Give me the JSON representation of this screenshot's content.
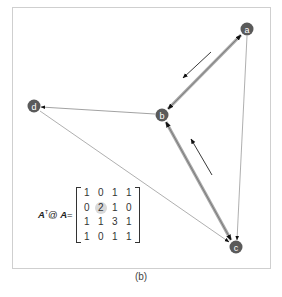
{
  "figure": {
    "caption": "(b)",
    "formula": {
      "lhs_a": "A",
      "sup": "T",
      "op": "@",
      "lhs_b": "A",
      "eq": "="
    },
    "matrix": [
      [
        "1",
        "0",
        "1",
        "1"
      ],
      [
        "0",
        "2",
        "1",
        "0"
      ],
      [
        "1",
        "1",
        "3",
        "1"
      ],
      [
        "1",
        "0",
        "1",
        "1"
      ]
    ],
    "highlighted_cell": [
      1,
      1
    ],
    "nodes": [
      {
        "id": "a",
        "label": "a",
        "x": 247,
        "y": 29
      },
      {
        "id": "b",
        "label": "b",
        "x": 162,
        "y": 115
      },
      {
        "id": "c",
        "label": "c",
        "x": 236,
        "y": 247
      },
      {
        "id": "d",
        "label": "d",
        "x": 34,
        "y": 106
      }
    ],
    "edges": [
      {
        "from": "a",
        "to": "b",
        "style": "thick-bidirectional"
      },
      {
        "from": "b",
        "to": "c",
        "style": "thick-bidirectional"
      },
      {
        "from": "b",
        "to": "d",
        "style": "thin-directed"
      },
      {
        "from": "d",
        "to": "c",
        "style": "thin-directed"
      },
      {
        "from": "a",
        "to": "c",
        "style": "thin-directed"
      }
    ],
    "flow_arrows": [
      {
        "label": "flow a to b",
        "direction": "down-left"
      },
      {
        "label": "flow c to b",
        "direction": "up-left"
      }
    ],
    "colors": {
      "node_fill": "#5a5a5a",
      "thick_edge": "#9a9a9a",
      "thin_edge": "#8a8a8a",
      "arrow": "#222222",
      "frame": "#cfcfcf"
    }
  }
}
